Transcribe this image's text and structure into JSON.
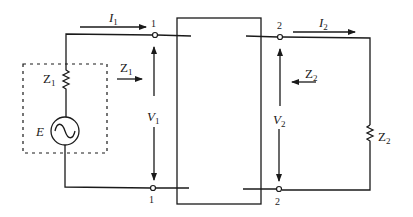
{
  "diagram": {
    "type": "two-port network",
    "port1": {
      "top_terminal": "1",
      "bottom_terminal": "1",
      "current": {
        "symbol": "I",
        "sub": "1"
      },
      "voltage": {
        "symbol": "V",
        "sub": "1"
      },
      "impedance_arrow": {
        "symbol": "Z",
        "sub": "1"
      }
    },
    "port2": {
      "top_terminal": "2",
      "bottom_terminal": "2",
      "current": {
        "symbol": "I",
        "sub": "2"
      },
      "voltage": {
        "symbol": "V",
        "sub": "2"
      },
      "impedance_arrow": {
        "symbol": "Z",
        "sub": "2"
      }
    },
    "source": {
      "emf": "E",
      "internal_impedance": {
        "symbol": "Z",
        "sub": "1"
      }
    },
    "load": {
      "impedance": {
        "symbol": "Z",
        "sub": "2"
      }
    }
  }
}
